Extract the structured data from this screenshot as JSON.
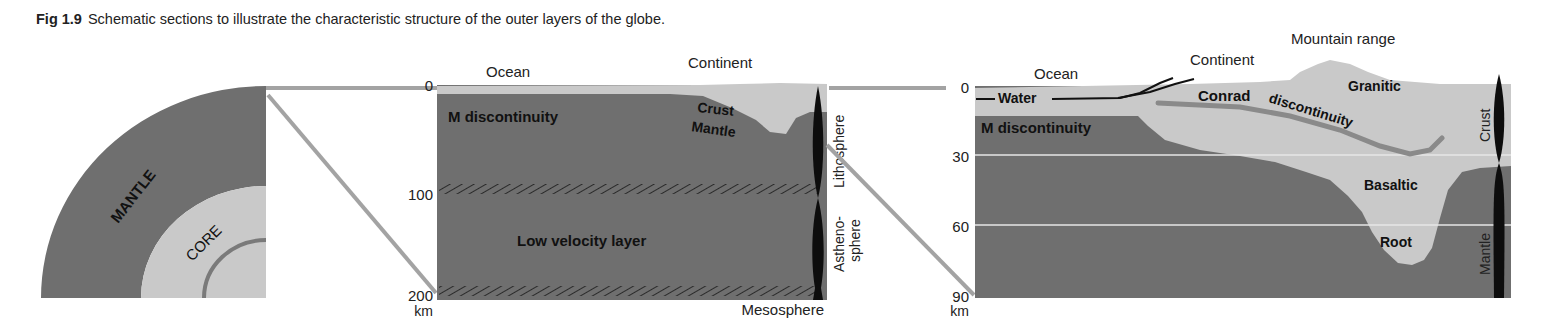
{
  "caption": {
    "figure_number": "Fig 1.9",
    "text": "Schematic sections to illustrate the characteristic structure of the outer layers of the globe."
  },
  "colors": {
    "mantle_dark": "#6f6f6f",
    "crust_light": "#c9c9c9",
    "connector_gray": "#a3a3a3",
    "bar_black": "#0d0d0d",
    "background": "#ffffff"
  },
  "globe_quadrant": {
    "mantle_label": "MANTLE",
    "core_label": "CORE"
  },
  "section_200km": {
    "depth_axis": {
      "ticks": [
        "0",
        "100",
        "200"
      ],
      "unit": "km"
    },
    "top_labels": {
      "ocean": "Ocean",
      "continent": "Continent"
    },
    "inner_labels": {
      "m_discontinuity": "M discontinuity",
      "crust": "Crust",
      "mantle": "Mantle",
      "low_velocity": "Low velocity layer"
    },
    "side_labels": {
      "lithosphere": "Lithosphere",
      "asthenosphere_1": "Astheno-",
      "asthenosphere_2": "sphere",
      "mesosphere": "Mesosphere"
    }
  },
  "section_90km": {
    "depth_axis": {
      "ticks": [
        "0",
        "30",
        "60",
        "90"
      ],
      "unit": "km"
    },
    "top_labels": {
      "ocean": "Ocean",
      "continent": "Continent",
      "mountain": "Mountain range"
    },
    "inner_labels": {
      "water": "Water",
      "m_discontinuity": "M discontinuity",
      "conrad": "Conrad",
      "conrad_disc": "discontinuity",
      "granitic": "Granitic",
      "basaltic": "Basaltic",
      "root": "Root"
    },
    "side_labels": {
      "crust": "Crust",
      "mantle": "Mantle"
    }
  }
}
